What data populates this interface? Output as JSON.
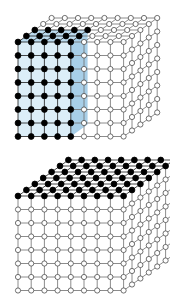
{
  "figure": {
    "background_color": "#ffffff",
    "panel_count": 2
  },
  "style": {
    "node_fill_open": "#ffffff",
    "node_fill_filled": "#000000",
    "node_stroke": "#4d4d4d",
    "node_stroke_dark": "#000000",
    "bond_color": "#6e6e6e",
    "bond_color_dark": "#1a1a1a",
    "slab_fill_light": "#dceef8",
    "slab_fill_mid": "#bcdcf0",
    "slab_fill_dark": "#a8cfe8",
    "node_radius": 2.6,
    "node_radius_filled": 2.9,
    "bond_width": 0.8
  },
  "chart_data": {
    "type": "diagram",
    "panels": [
      {
        "id": "panel-top",
        "name": "cube-with-blue-slab",
        "description": "Cubic lattice drawn in oblique projection with a blue translucent slab on the left portion whose lattice sites are filled black",
        "grid": {
          "nx": 9,
          "ny": 8,
          "nz": 5
        },
        "projection": {
          "origin_x": 18,
          "origin_y": 42,
          "dx": 13.2,
          "dy": 13.5,
          "depth_dx": 8.4,
          "depth_dy": -6.0
        },
        "highlight": {
          "shape": "slab",
          "columns": 5,
          "rows": 8,
          "depth": 3,
          "fill_color": "#dceef8",
          "side_fill_color": "#a8cfe8",
          "top_fill_color": "#bcdcf0",
          "filled_node_color": "#000000"
        },
        "filled_nodes": 5,
        "open_nodes": 4
      },
      {
        "id": "panel-bottom",
        "name": "cube-with-black-top-layer",
        "description": "Cubic lattice in oblique projection whose entire top face layer of sites is filled black while all interior and side sites remain open",
        "grid": {
          "nx": 9,
          "ny": 8,
          "nz": 7
        },
        "projection": {
          "origin_x": 18,
          "origin_y": 51,
          "dx": 13.2,
          "dy": 13.5,
          "depth_dx": 8.4,
          "depth_dy": -6.0
        },
        "highlight": {
          "shape": "top-layer",
          "columns": 9,
          "rows": 1,
          "depth": 7,
          "filled_node_color": "#000000"
        },
        "filled_nodes": 1,
        "open_nodes": 7
      }
    ],
    "legend": [
      {
        "symbol": "filled-circle",
        "color": "#000000",
        "label": "occupied site"
      },
      {
        "symbol": "open-circle",
        "color": "#ffffff",
        "label": "empty site"
      },
      {
        "symbol": "blue-slab",
        "color": "#dceef8",
        "label": "selected region"
      }
    ]
  }
}
